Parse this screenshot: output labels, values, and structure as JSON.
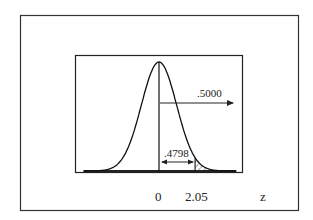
{
  "chart_data": {
    "type": "area",
    "title": "",
    "xlabel": "z",
    "ylabel": "",
    "tick_labels": [
      "0",
      "2.05"
    ],
    "annotations": [
      {
        "label": ".5000",
        "type": "arrow",
        "from_z": 0,
        "direction": "right",
        "meaning": "area to the right of 0"
      },
      {
        "label": ".4798",
        "type": "double-arrow",
        "from_z": 0,
        "to_z": 2.05,
        "meaning": "area between 0 and 2.05"
      }
    ],
    "shaded_region": {
      "from_z": 2.05,
      "to_z": "inf",
      "pattern": "hatched"
    },
    "series": [
      {
        "name": "standard normal density",
        "mean": 0,
        "sd": 1
      }
    ],
    "grid": false,
    "legend": "none"
  },
  "labels": {
    "half_area": ".5000",
    "between_area": ".4798",
    "tick_zero": "0",
    "tick_z": "2.05",
    "axis": "z"
  }
}
